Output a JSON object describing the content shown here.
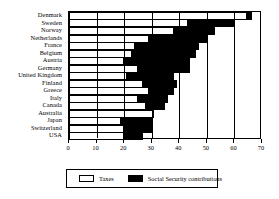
{
  "chart_data": {
    "type": "bar",
    "orientation": "horizontal",
    "stacked": true,
    "title": "",
    "subtitle": "",
    "xlabel": "",
    "ylabel": "",
    "xlim": [
      0,
      70
    ],
    "xticks": [
      0,
      10,
      20,
      30,
      40,
      50,
      60,
      70
    ],
    "xtick_labels": [
      "0",
      "10",
      "20",
      "30",
      "40",
      "50",
      "60",
      "70"
    ],
    "grid": true,
    "grid_axis": "x",
    "legend_position": "bottom",
    "categories": [
      "Denmark",
      "Sweden",
      "Norway",
      "Netherlands",
      "France",
      "Belgium",
      "Austria",
      "Germany",
      "United Kingdom",
      "Finland",
      "Greece",
      "Italy",
      "Canada",
      "Australia",
      "Japan",
      "Switzerland",
      "USA"
    ],
    "series": [
      {
        "name": "Taxes",
        "color": "#ffffff",
        "values": [
          64.5,
          43.0,
          38.0,
          29.0,
          24.0,
          23.0,
          20.0,
          25.0,
          21.0,
          27.0,
          29.0,
          25.0,
          28.0,
          31.0,
          19.0,
          20.0,
          20.0
        ]
      },
      {
        "name": "Social Security contributions",
        "color": "#000000",
        "values": [
          2.0,
          17.0,
          15.0,
          21.0,
          23.0,
          23.0,
          24.0,
          19.0,
          17.0,
          12.0,
          9.0,
          11.0,
          7.0,
          0.0,
          11.0,
          10.0,
          7.0
        ]
      }
    ],
    "totals": [
      66.5,
      60.0,
      53.0,
      50.0,
      47.0,
      46.0,
      44.0,
      44.0,
      38.0,
      39.0,
      38.0,
      36.0,
      35.0,
      31.0,
      30.0,
      30.0,
      27.0
    ]
  },
  "legend": {
    "taxes_label": "Taxes",
    "ssc_label": "Social Security contributions"
  }
}
